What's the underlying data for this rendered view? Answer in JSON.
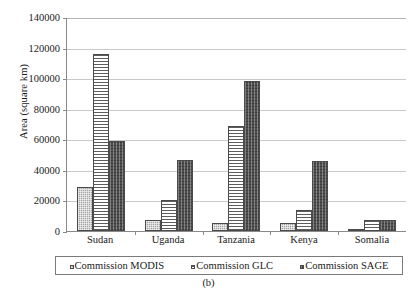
{
  "chart_data": {
    "type": "bar",
    "title": "",
    "xlabel": "",
    "ylabel": "Area (square km)",
    "ylim": [
      0,
      140000
    ],
    "ytick_step": 20000,
    "yticks": [
      "0",
      "20000",
      "40000",
      "60000",
      "80000",
      "100000",
      "120000",
      "140000"
    ],
    "grid": true,
    "legend_position": "bottom",
    "categories": [
      "Sudan",
      "Uganda",
      "Tanzania",
      "Kenya",
      "Somalia"
    ],
    "series": [
      {
        "name": "Commission MODIS",
        "values": [
          28800,
          7500,
          5000,
          5000,
          1000
        ],
        "color": "#a6a6a6",
        "pattern": "cross-hatch"
      },
      {
        "name": "Commission GLC",
        "values": [
          116000,
          20000,
          69000,
          14000,
          7000
        ],
        "color": "#ffffff",
        "pattern": "horizontal-lines"
      },
      {
        "name": "Commission SAGE",
        "values": [
          59000,
          46500,
          98000,
          45500,
          7500
        ],
        "color": "#4f4f4f",
        "pattern": "dense-dark"
      }
    ]
  },
  "caption": {
    "text": "(b)"
  },
  "legend": {
    "items": [
      {
        "label": "Commission MODIS",
        "marker": "swatch-modis"
      },
      {
        "label": "Commission GLC",
        "marker": "swatch-glc"
      },
      {
        "label": "Commission SAGE",
        "marker": "swatch-sage"
      }
    ]
  }
}
